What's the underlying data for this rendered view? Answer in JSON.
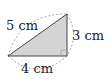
{
  "diagram": {
    "type": "right-triangle",
    "labels": {
      "hypotenuse": "5 cm",
      "vertical_leg": "3 cm",
      "horizontal_leg": "4 cm"
    },
    "colors": {
      "fill": "#d4d4d4",
      "stroke": "#444444",
      "dashed": "#8a8a8a",
      "text": "#222222"
    }
  }
}
